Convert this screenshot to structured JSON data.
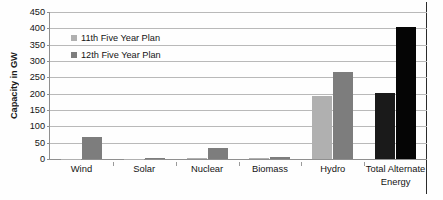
{
  "chart_data": {
    "type": "bar",
    "title": "",
    "subtitle": "",
    "xlabel": "",
    "ylabel": "Capacity in GW",
    "ylim": [
      0,
      450
    ],
    "ytick_step": 50,
    "yticks": [
      450,
      400,
      350,
      300,
      250,
      200,
      150,
      100,
      50,
      0
    ],
    "grid": true,
    "legend_position": "inside-top-left",
    "categories": [
      "Wind",
      "Solar",
      "Nuclear",
      "Biomass",
      "Hydro",
      "Total Alternate Energy"
    ],
    "category_lines": [
      [
        "Wind"
      ],
      [
        "Solar"
      ],
      [
        "Nuclear"
      ],
      [
        "Biomass"
      ],
      [
        "Hydro"
      ],
      [
        "Total Alternate",
        "Energy"
      ]
    ],
    "series": [
      {
        "name": "11th Five Year Plan",
        "color": "#b0b0b0",
        "values": [
          1,
          0.5,
          4,
          2,
          193,
          202
        ]
      },
      {
        "name": "12th Five Year Plan",
        "color": "#7d7d7d",
        "values": [
          67,
          4,
          35,
          6,
          267,
          405
        ]
      }
    ],
    "series_colors_last_category": [
      "#1a1a1a",
      "#050505"
    ]
  },
  "legend": {
    "items": [
      {
        "label": "11th Five Year Plan"
      },
      {
        "label": "12th Five Year Plan"
      }
    ]
  },
  "axis": {
    "y_title": "Capacity in GW"
  }
}
